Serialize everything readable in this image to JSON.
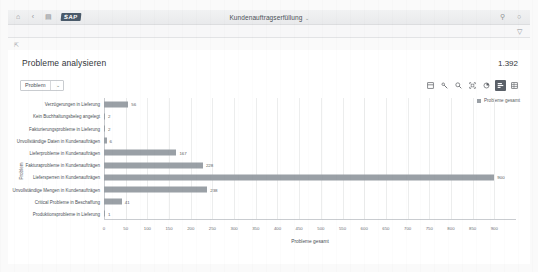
{
  "shell": {
    "left_icons": [
      {
        "name": "home-icon",
        "glyph": "⌂"
      },
      {
        "name": "back-icon",
        "glyph": "‹"
      },
      {
        "name": "menu-icon",
        "glyph": "▤"
      }
    ],
    "logo_text": "SAP",
    "title": "Kundenauftragserfüllung",
    "title_caret": "⌄",
    "right_icons": [
      {
        "name": "search-icon",
        "glyph": "⚲"
      },
      {
        "name": "user-avatar-icon",
        "glyph": "○"
      }
    ],
    "filter_icon": "filter-funnel-icon",
    "breadcrumb_icon": "back-arrow-icon"
  },
  "page": {
    "title": "Probleme analysieren",
    "kpi_count": "1.392"
  },
  "toolbar": {
    "dimension_select_label": "Problem",
    "dimension_select_chevron": "⌄",
    "icons": [
      {
        "name": "drill-down-icon",
        "active": false
      },
      {
        "name": "settings-wrench-icon",
        "active": false
      },
      {
        "name": "zoom-icon",
        "active": false
      },
      {
        "name": "fullscreen-icon",
        "active": false
      },
      {
        "name": "pie-chart-icon",
        "active": false
      },
      {
        "name": "bar-chart-icon",
        "active": true
      },
      {
        "name": "table-view-icon",
        "active": false
      }
    ]
  },
  "legend": {
    "label": "Probleme gesamt",
    "color": "#9aa0a6"
  },
  "chart_data": {
    "type": "bar",
    "orientation": "horizontal",
    "title": "Probleme analysieren",
    "xlabel": "Probleme gesamt",
    "ylabel": "Problem",
    "xlim": [
      0,
      950
    ],
    "grid": true,
    "legend_position": "top-right",
    "series_name": "Probleme gesamt",
    "color": "#9aa0a6",
    "ticks": [
      0,
      50,
      100,
      150,
      200,
      250,
      300,
      350,
      400,
      450,
      500,
      550,
      600,
      650,
      700,
      750,
      800,
      850,
      900
    ],
    "categories": [
      "Verzögerungen in Lieferung",
      "Kein Buchhaltungsbeleg angelegt",
      "Fakturierungsprobleme in Lieferung",
      "Unvollständige Daten in Kundenaufträgen",
      "Lieferprobleme in Kundenaufträgen",
      "Fakturaprobleme in Kundenaufträgen",
      "Liefersperren in Kundenaufträgen",
      "Unvollständige Mengen in Kundenaufträgen",
      "Critical Probleme in Beschaffung",
      "Produktionsprobleme in Lieferung"
    ],
    "values": [
      56,
      2,
      2,
      6,
      167,
      228,
      900,
      238,
      41,
      1
    ],
    "value_labels": [
      "56",
      "2",
      "2",
      "6",
      "167",
      "228",
      "900",
      "238",
      "41",
      "1"
    ]
  }
}
